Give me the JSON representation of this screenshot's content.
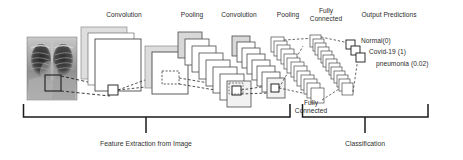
{
  "figure": {
    "background": "#ffffff",
    "line_color": "#333333",
    "sheet_fill": "#ffffff",
    "sheet_shadow_fill": "#d9d9d9",
    "text_color": "#2b2b2b"
  },
  "stage_labels": [
    {
      "id": "conv1",
      "text": "Convolution",
      "x": 124,
      "y": 12
    },
    {
      "id": "pool1",
      "text": "Pooling",
      "x": 192,
      "y": 12
    },
    {
      "id": "conv2",
      "text": "Convolution",
      "x": 239,
      "y": 12
    },
    {
      "id": "pool2",
      "text": "Pooling",
      "x": 288,
      "y": 12
    },
    {
      "id": "fc1_line1",
      "text": "Fully",
      "x": 326,
      "y": 9
    },
    {
      "id": "fc1_line2",
      "text": "Connected",
      "x": 326,
      "y": 17
    },
    {
      "id": "output",
      "text": "Output Predictions",
      "x": 389,
      "y": 12
    }
  ],
  "fc2_label": {
    "line1": "Fully",
    "line2": "Connected",
    "x": 311,
    "y": 103
  },
  "predictions": [
    {
      "label": "Normal(0)",
      "x": 355,
      "y": 40
    },
    {
      "label": "Covid-19 (1)",
      "x": 363,
      "y": 51
    },
    {
      "label": "pneumonia (0.02)",
      "x": 372,
      "y": 63
    }
  ],
  "brackets": [
    {
      "id": "feature-extraction",
      "caption": "Feature Extraction from Image",
      "x_start": 23,
      "x_end": 290,
      "tick_x": 146,
      "caption_x": 146,
      "caption_y": 144
    },
    {
      "id": "classification",
      "caption": "Classification",
      "x_start": 302,
      "x_end": 428,
      "tick_x": 365,
      "caption_x": 365,
      "caption_y": 144
    }
  ],
  "bracket_geometry": {
    "bar_y": 117,
    "stub_top": 104,
    "tick_bottom": 133
  },
  "input_image": {
    "name": "chest-xray",
    "alt": "Chest X-ray radiograph",
    "x": 27,
    "y": 37,
    "width": 50,
    "height": 63,
    "roi_box": {
      "x": 45,
      "y": 75,
      "w": 16,
      "h": 16
    }
  },
  "layers": [
    {
      "id": "conv1",
      "type": "sheet-stack",
      "count": 3,
      "x": 88,
      "y": 33,
      "w": 46,
      "h": 52,
      "dx": -7,
      "dy": -6
    },
    {
      "id": "pool1",
      "type": "sheet-stack",
      "count": 2,
      "x": 152,
      "y": 52,
      "w": 36,
      "h": 42,
      "dx": -8,
      "dy": -8
    },
    {
      "id": "conv2",
      "type": "diagonal-stack",
      "count": 8,
      "x": 178,
      "y": 32,
      "w": 24,
      "h": 26,
      "dx": 7,
      "dy": 7
    },
    {
      "id": "pool2",
      "type": "diagonal-stack",
      "count": 8,
      "x": 232,
      "y": 36,
      "w": 18,
      "h": 20,
      "dx": 5,
      "dy": 6
    },
    {
      "id": "fc1",
      "type": "diagonal-stack",
      "count": 13,
      "x": 271,
      "y": 37,
      "w": 13,
      "h": 15,
      "dx": 3.3,
      "dy": 4.2
    },
    {
      "id": "fc2",
      "type": "diagonal-stack",
      "count": 13,
      "x": 310,
      "y": 35,
      "w": 11,
      "h": 12,
      "dx": 2.8,
      "dy": 3.8
    },
    {
      "id": "output",
      "type": "diagonal-stack",
      "count": 3,
      "x": 346,
      "y": 40,
      "w": 9,
      "h": 9,
      "dx": 5,
      "dy": 6
    }
  ]
}
